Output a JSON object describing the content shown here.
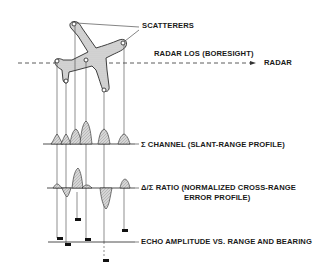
{
  "diagram": {
    "type": "radar monopulse imaging illustration",
    "labels": {
      "scatterers": "SCATTERERS",
      "radar_los": "RADAR LOS (BORESIGHT)",
      "radar": "RADAR",
      "sigma_channel": "Σ CHANNEL (SLANT-RANGE PROFILE)",
      "ratio_line1": "Δ/Σ RATIO (NORMALIZED CROSS-RANGE",
      "ratio_line2": "ERROR PROFILE)",
      "echo": "ECHO AMPLITUDE VS. RANGE AND BEARING"
    },
    "scatterer_points": [
      {
        "id": 1,
        "x": 57,
        "y": 61
      },
      {
        "id": 2,
        "x": 66,
        "y": 81
      },
      {
        "id": 3,
        "x": 74,
        "y": 24
      },
      {
        "id": 4,
        "x": 86,
        "y": 60
      },
      {
        "id": 5,
        "x": 104,
        "y": 90
      },
      {
        "id": 6,
        "x": 123,
        "y": 43
      }
    ],
    "colors": {
      "ink": "#1a1a1a",
      "fill": "#d4d4d4",
      "background": "#ffffff"
    }
  }
}
